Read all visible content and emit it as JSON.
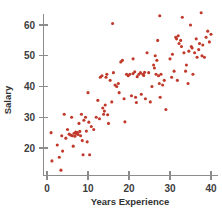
{
  "chart_data": {
    "type": "scatter",
    "title": "",
    "xlabel": "Years Experience",
    "ylabel": "Salary",
    "xlim": [
      -1,
      41
    ],
    "ylim": [
      10,
      66
    ],
    "xticks": [
      0,
      10,
      20,
      30,
      40
    ],
    "yticks": [
      20,
      30,
      40,
      50,
      60
    ],
    "xtick_labels": [
      "0",
      "10",
      "20",
      "30",
      "40"
    ],
    "ytick_labels": [
      "20",
      "30",
      "40",
      "50",
      "60"
    ],
    "grid": false,
    "legend": null,
    "marker_color": "#c0392b",
    "axis_color": "#8c8c8c",
    "background_color": "#ffffff",
    "points": [
      [
        1.0,
        25.0
      ],
      [
        1.2,
        15.8
      ],
      [
        2.5,
        21.0
      ],
      [
        3.0,
        17.0
      ],
      [
        3.4,
        12.8
      ],
      [
        3.6,
        24.0
      ],
      [
        3.8,
        19.0
      ],
      [
        4.2,
        31.0
      ],
      [
        4.6,
        23.2
      ],
      [
        5.0,
        26.0
      ],
      [
        5.4,
        24.5
      ],
      [
        5.8,
        24.2
      ],
      [
        6.0,
        30.0
      ],
      [
        6.2,
        24.0
      ],
      [
        6.4,
        20.6
      ],
      [
        6.6,
        24.8
      ],
      [
        6.8,
        23.8
      ],
      [
        7.0,
        25.2
      ],
      [
        7.2,
        24.6
      ],
      [
        7.4,
        25.0
      ],
      [
        7.6,
        24.4
      ],
      [
        7.8,
        28.0
      ],
      [
        8.0,
        25.4
      ],
      [
        8.2,
        24.0
      ],
      [
        8.4,
        31.0
      ],
      [
        8.6,
        22.4
      ],
      [
        8.8,
        17.8
      ],
      [
        9.0,
        29.0
      ],
      [
        9.4,
        30.0
      ],
      [
        9.6,
        25.5
      ],
      [
        9.8,
        22.0
      ],
      [
        10.0,
        38.0
      ],
      [
        10.2,
        28.4
      ],
      [
        10.4,
        17.8
      ],
      [
        10.8,
        27.0
      ],
      [
        11.4,
        26.0
      ],
      [
        12.0,
        30.0
      ],
      [
        12.4,
        35.5
      ],
      [
        12.8,
        29.5
      ],
      [
        13.0,
        43.0
      ],
      [
        13.4,
        43.5
      ],
      [
        13.6,
        33.0
      ],
      [
        13.8,
        31.0
      ],
      [
        14.0,
        32.0
      ],
      [
        14.2,
        34.0
      ],
      [
        14.4,
        43.0
      ],
      [
        14.6,
        44.0
      ],
      [
        14.8,
        30.8
      ],
      [
        15.0,
        28.0
      ],
      [
        15.4,
        42.0
      ],
      [
        15.8,
        35.0
      ],
      [
        16.2,
        44.5
      ],
      [
        16.6,
        40.5
      ],
      [
        17.0,
        40.0
      ],
      [
        17.4,
        41.0
      ],
      [
        17.6,
        38.0
      ],
      [
        18.0,
        48.0
      ],
      [
        18.4,
        48.5
      ],
      [
        18.8,
        36.0
      ],
      [
        19.0,
        28.5
      ],
      [
        19.4,
        44.0
      ],
      [
        19.8,
        43.5
      ],
      [
        20.2,
        44.0
      ],
      [
        20.6,
        37.0
      ],
      [
        21.0,
        44.2
      ],
      [
        21.4,
        44.8
      ],
      [
        21.6,
        36.5
      ],
      [
        21.8,
        34.8
      ],
      [
        22.0,
        43.2
      ],
      [
        22.4,
        44.0
      ],
      [
        22.8,
        44.5
      ],
      [
        23.0,
        37.5
      ],
      [
        23.4,
        44.0
      ],
      [
        23.6,
        43.6
      ],
      [
        23.8,
        44.6
      ],
      [
        24.0,
        36.0
      ],
      [
        24.4,
        51.0
      ],
      [
        24.8,
        44.5
      ],
      [
        25.2,
        35.0
      ],
      [
        25.6,
        40.0
      ],
      [
        26.0,
        47.0
      ],
      [
        26.2,
        46.0
      ],
      [
        26.4,
        50.0
      ],
      [
        26.6,
        44.0
      ],
      [
        26.8,
        48.5
      ],
      [
        27.0,
        55.0
      ],
      [
        27.2,
        43.5
      ],
      [
        27.4,
        41.0
      ],
      [
        27.6,
        36.5
      ],
      [
        27.8,
        44.0
      ],
      [
        28.2,
        40.5
      ],
      [
        28.6,
        42.0
      ],
      [
        29.0,
        32.5
      ],
      [
        30.0,
        49.0
      ],
      [
        30.4,
        43.0
      ],
      [
        30.6,
        50.5
      ],
      [
        31.0,
        45.0
      ],
      [
        31.4,
        56.0
      ],
      [
        31.6,
        55.5
      ],
      [
        31.8,
        42.0
      ],
      [
        32.0,
        56.5
      ],
      [
        32.2,
        54.0
      ],
      [
        32.6,
        55.0
      ],
      [
        32.8,
        53.0
      ],
      [
        33.0,
        62.5
      ],
      [
        33.4,
        51.0
      ],
      [
        33.8,
        45.0
      ],
      [
        34.0,
        47.0
      ],
      [
        34.4,
        41.0
      ],
      [
        34.6,
        51.5
      ],
      [
        35.0,
        60.0
      ],
      [
        35.2,
        53.0
      ],
      [
        35.4,
        52.5
      ],
      [
        35.6,
        44.0
      ],
      [
        36.0,
        51.0
      ],
      [
        36.4,
        55.5
      ],
      [
        36.6,
        49.5
      ],
      [
        37.0,
        52.0
      ],
      [
        37.2,
        54.0
      ],
      [
        37.6,
        64.0
      ],
      [
        37.8,
        50.0
      ],
      [
        38.0,
        53.5
      ],
      [
        38.4,
        49.5
      ],
      [
        38.8,
        56.0
      ],
      [
        39.2,
        58.0
      ],
      [
        39.6,
        54.5
      ],
      [
        40.0,
        57.0
      ],
      [
        27.5,
        63.0
      ],
      [
        16.0,
        60.5
      ],
      [
        21.0,
        49.0
      ]
    ]
  }
}
